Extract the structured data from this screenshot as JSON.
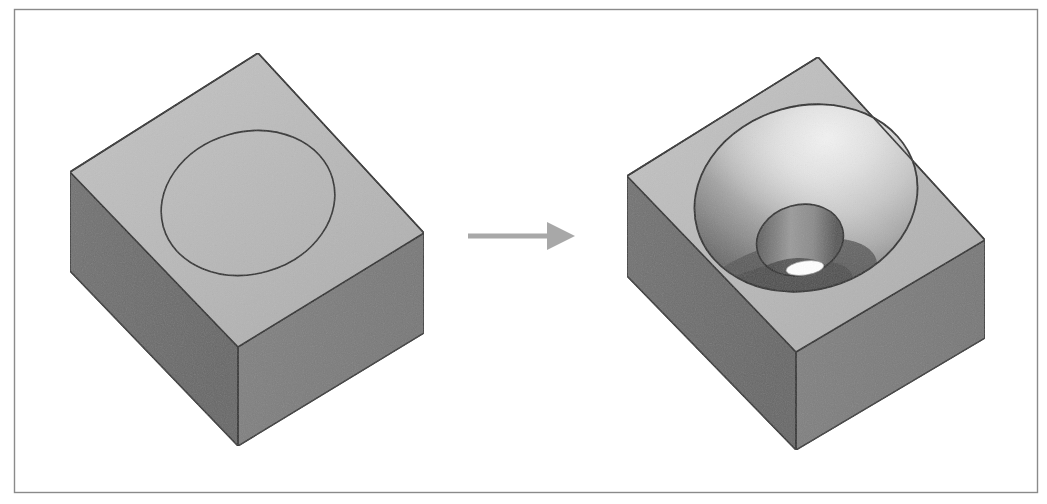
{
  "figure": {
    "description": "Isometric CAD illustration: a rectangular block with a circle scribed on its top face transforms into the same block with a spherical pocket and a cylindrical through-hole cut into it.",
    "background_color": "#ffffff",
    "border": {
      "label": "figure-border",
      "color": "#8a8a8a",
      "width_px": 1,
      "x": 14,
      "y": 9,
      "width": 1023,
      "height": 483
    },
    "palette": {
      "top_face": "#b9b9b9",
      "top_face_edge_light": "#c6c6c6",
      "left_face": "#6f6f6f",
      "front_face": "#7e7e7e",
      "outline": "#2b2b2b",
      "cavity_highlight": "#e8e8e8",
      "cavity_midtone": "#b0b0b0",
      "cavity_shadow": "#5d5d5d",
      "hole_wall": "#8f8f8f",
      "hole_shadow": "#4a4a4a",
      "through_hole_open": "#ffffff",
      "arrow": "#a8a8a8"
    },
    "stage_left": {
      "label": "Block with scribed circle",
      "name": "before-block",
      "block": {
        "top_apex": [
          258,
          53
        ],
        "top_left": [
          70,
          172
        ],
        "top_front": [
          238,
          347
        ],
        "top_right": [
          424,
          233
        ],
        "bottom_left": [
          70,
          271
        ],
        "bottom_front": [
          238,
          446
        ],
        "bottom_right": [
          424,
          333
        ],
        "height_px": 99
      },
      "scribed_circle": {
        "name": "scribed-circle",
        "center": [
          248,
          203
        ],
        "rx": 88,
        "ry": 71,
        "rotation_deg": -16,
        "stroke": "#2b2b2b",
        "stroke_width": 1.6,
        "fill": "none"
      }
    },
    "stage_right": {
      "label": "Block with spherical cavity and through-hole",
      "name": "after-block",
      "block": {
        "top_apex": [
          818,
          57
        ],
        "top_left": [
          627,
          176
        ],
        "top_front": [
          796,
          352
        ],
        "top_right": [
          985,
          240
        ],
        "bottom_left": [
          627,
          276
        ],
        "bottom_front": [
          796,
          450
        ],
        "bottom_right": [
          985,
          338
        ],
        "height_px": 99
      },
      "cavity": {
        "name": "spherical-cavity",
        "rim_center": [
          806,
          198
        ],
        "rim_rx": 113,
        "rim_ry": 92,
        "rotation_deg": -16,
        "stroke": "#2b2b2b",
        "stroke_width": 1.8,
        "depth_description": "hemispherical pocket shaded bright at upper-right fading to dark at lower-left"
      },
      "through_hole": {
        "name": "through-hole",
        "center": [
          800,
          240
        ],
        "rx": 44,
        "ry": 35,
        "rotation_deg": -16,
        "opening": {
          "center": [
            805,
            268
          ],
          "rx": 19,
          "ry": 7,
          "fill": "#ffffff"
        }
      }
    },
    "arrow": {
      "name": "transform-arrow",
      "label": "transforms into",
      "color": "#a8a8a8",
      "shaft_start_x": 468,
      "shaft_end_x": 552,
      "tip_x": 575,
      "y": 236,
      "shaft_thickness": 5,
      "head_half_height": 14
    }
  }
}
